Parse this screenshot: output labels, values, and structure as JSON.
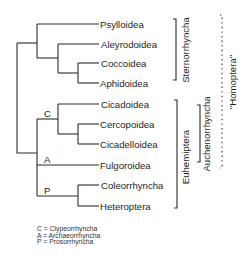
{
  "diagram": {
    "type": "phylogenetic-tree",
    "taxa": [
      {
        "name": "Psylloidea"
      },
      {
        "name": "Aleyrodoidea"
      },
      {
        "name": "Coccoidea"
      },
      {
        "name": "Aphidoidea"
      },
      {
        "name": "Cicadoidea"
      },
      {
        "name": "Cercopoidea"
      },
      {
        "name": "Cicadelloidea"
      },
      {
        "name": "Fulgoroidea"
      },
      {
        "name": "Coleorrhyncha"
      },
      {
        "name": "Heteroptera"
      }
    ],
    "node_labels": [
      {
        "symbol": "C"
      },
      {
        "symbol": "A"
      },
      {
        "symbol": "P"
      }
    ],
    "clades": [
      {
        "name": "Sternorrhyncha",
        "style": "solid"
      },
      {
        "name": "Euhemiptera",
        "style": "solid"
      },
      {
        "name": "Auchenorrhyncha",
        "style": "solid"
      },
      {
        "name": "\"Homoptera\"",
        "style": "dotted"
      }
    ],
    "legend": [
      {
        "text": "C = Clypeorrhyncha"
      },
      {
        "text": "A = Archaeorrhyncha"
      },
      {
        "text": "P = Prosorrhyncha"
      }
    ]
  }
}
